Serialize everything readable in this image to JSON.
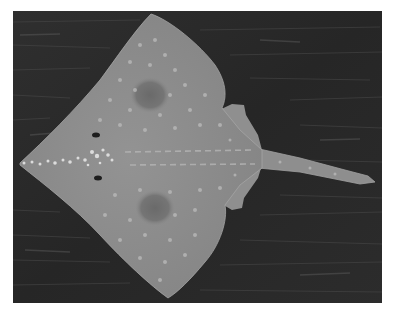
{
  "image": {
    "subject": "Skate (ray) viewed from above on dark wooden surface",
    "style": "grayscale photograph",
    "frame_color": "#ffffff",
    "background_color": "#2b2b2b",
    "body_color": "#8c8c8c",
    "eyespot_color": "#6f6f6f",
    "spot_color": "#b8b8b8"
  }
}
